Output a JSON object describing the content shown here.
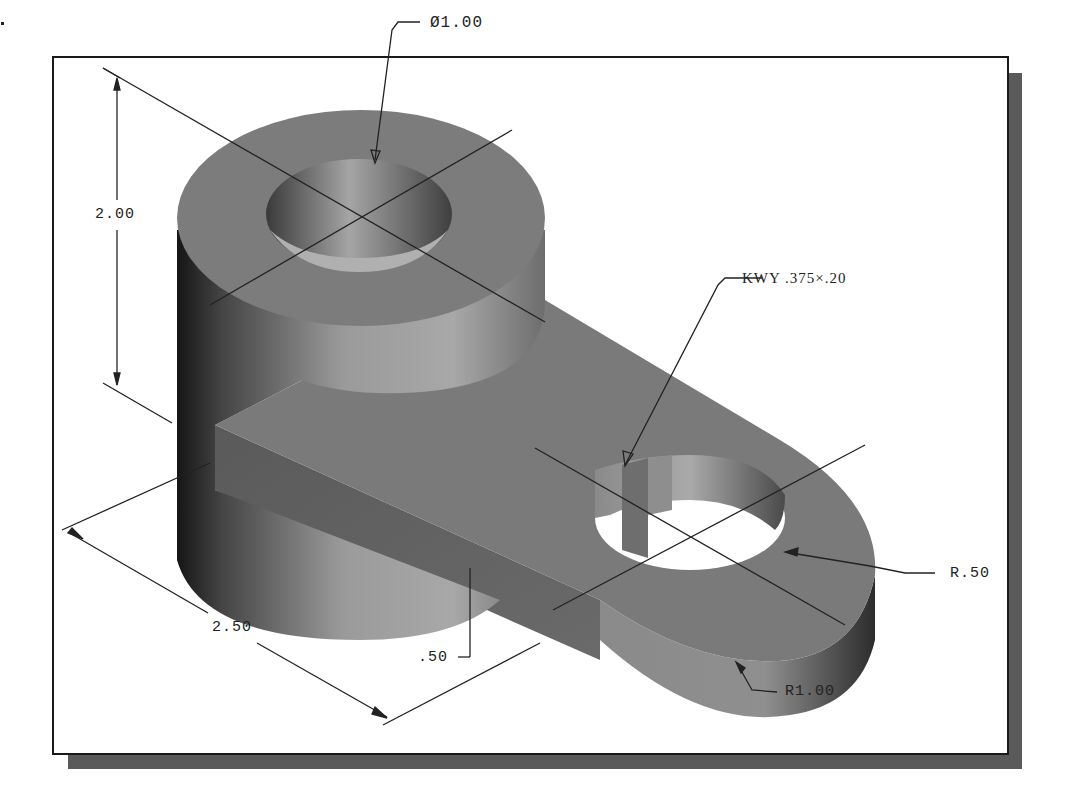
{
  "drawing": {
    "type": "isometric shaded part with dimensions",
    "colors": {
      "background": "#ffffff",
      "frame": "#1a1a1a",
      "shadow": "#5a5a5a",
      "part_face": "#7c7c7c",
      "dimension_line": "#222222"
    }
  },
  "dimensions": {
    "hole_diameter": "Ø1.00",
    "height": "2.00",
    "keyway": "KWY .375×.20",
    "small_radius": "R.50",
    "large_radius": "R1.00",
    "length": "2.50",
    "thickness": ".50"
  }
}
